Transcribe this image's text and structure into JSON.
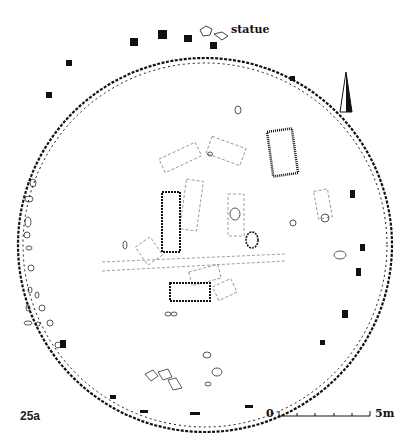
{
  "figure": {
    "id_label": "25a",
    "annotation": "statue",
    "scale_bar": {
      "start_label": "0",
      "end_label": "5m",
      "divisions": 5
    },
    "north_arrow": "north-arrow",
    "colors": {
      "ink": "#111111",
      "background": "#ffffff",
      "dashed": "#888888"
    }
  }
}
